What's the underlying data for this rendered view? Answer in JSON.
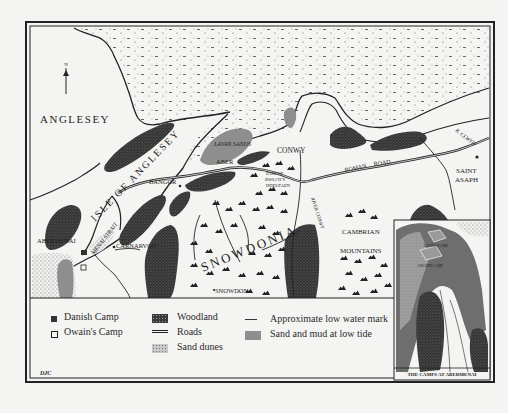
{
  "map": {
    "north_arrow": "N",
    "place_labels": {
      "anglesey": "ANGLESEY",
      "isle_of_anglesey": "ISLE OF ANGLESEY",
      "menai_strait": "MENAI STRAIT",
      "lavan_sands": "LAVAN SANDS",
      "aber": "ABER",
      "conwy": "CONWY",
      "bangor": "BANGOR",
      "abermenai": "ABERMENAI",
      "carnarvon": "CARNARVON",
      "snowdonia": "SNOWDONIA",
      "snowdon": "SNOWDON",
      "pass_line1": "PASS OF",
      "pass_line2": "BWLCH Y",
      "pass_line3": "DDEUFAEN",
      "river_conwy": "RIVER CONWY",
      "roman_road": "ROMAN",
      "roman_road2": "ROAD",
      "r_clwyd": "R. CLWYD",
      "saint": "SAINT",
      "asaph": "ASAPH",
      "cambrian": "CAMBRIAN",
      "mountains": "MOUNTAINS"
    },
    "inset": {
      "title": "THE CAMPS AT ABERMENAI",
      "danish_label": "DANISH CAMP",
      "owain_label": "OWAIN'S CAMP"
    },
    "credit": "DJC",
    "colors": {
      "paper": "#f4f4f2",
      "ink": "#1e1e1e",
      "woodland": "#3a3a3a",
      "sand_mud": "#8e8e8e",
      "sea_dots": "#555555"
    }
  },
  "legend": {
    "items": [
      {
        "symbol": "filled-square",
        "label": "Danish Camp"
      },
      {
        "symbol": "open-square",
        "label": "Owain's Camp"
      },
      {
        "symbol": "woodland-swatch",
        "label": "Woodland"
      },
      {
        "symbol": "double-line",
        "label": "Roads"
      },
      {
        "symbol": "sand-dunes-swatch",
        "label": "Sand dunes"
      },
      {
        "symbol": "thin-line",
        "label": "Approximate low water mark"
      },
      {
        "symbol": "grey-swatch",
        "label": "Sand and mud at low tide"
      }
    ]
  }
}
